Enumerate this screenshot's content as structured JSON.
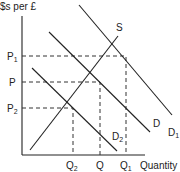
{
  "diagram": {
    "y_axis_label": "$s per £",
    "x_axis_label": "Quantity",
    "price_labels": {
      "p1": {
        "main": "P",
        "sub": "1"
      },
      "p": {
        "main": "P",
        "sub": ""
      },
      "p2": {
        "main": "P",
        "sub": "2"
      }
    },
    "quantity_labels": {
      "q2": {
        "main": "Q",
        "sub": "2"
      },
      "q": {
        "main": "Q",
        "sub": ""
      },
      "q1": {
        "main": "Q",
        "sub": "1"
      }
    },
    "curves": {
      "supply": {
        "main": "S",
        "sub": ""
      },
      "demand": {
        "main": "D",
        "sub": ""
      },
      "demand1": {
        "main": "D",
        "sub": "1"
      },
      "demand2": {
        "main": "D",
        "sub": "2"
      }
    }
  }
}
